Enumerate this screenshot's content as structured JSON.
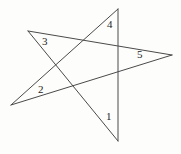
{
  "figure": {
    "name": "five-pointed-star-angles",
    "background_color": "#fdfdfc",
    "stroke_color": "#4a4a4a",
    "stroke_width": 1,
    "label_color": "#1d1d1d",
    "width": 181,
    "height": 154
  },
  "chart_data": {
    "type": "diagram",
    "title": "",
    "shape": "pentagram",
    "vertices": [
      {
        "id": "top",
        "label": "A",
        "x": 118,
        "y": 9
      },
      {
        "id": "upper-left",
        "label": "B",
        "x": 28,
        "y": 31
      },
      {
        "id": "left",
        "label": "C",
        "x": 11,
        "y": 105
      },
      {
        "id": "bottom",
        "label": "D",
        "x": 118,
        "y": 141
      },
      {
        "id": "right",
        "label": "E",
        "x": 172,
        "y": 55
      }
    ],
    "edges": [
      {
        "from": "top",
        "to": "bottom"
      },
      {
        "from": "top",
        "to": "left"
      },
      {
        "from": "upper-left",
        "to": "right"
      },
      {
        "from": "upper-left",
        "to": "bottom"
      },
      {
        "from": "left",
        "to": "right"
      }
    ],
    "labels": [
      {
        "text": "1",
        "x": 106,
        "y": 111,
        "at_vertex": "bottom"
      },
      {
        "text": "2",
        "x": 38,
        "y": 84,
        "at_vertex": "left"
      },
      {
        "text": "3",
        "x": 42,
        "y": 36,
        "at_vertex": "upper-left"
      },
      {
        "text": "4",
        "x": 107,
        "y": 19,
        "at_vertex": "top"
      },
      {
        "text": "5",
        "x": 137,
        "y": 49,
        "at_vertex": "right"
      }
    ]
  }
}
